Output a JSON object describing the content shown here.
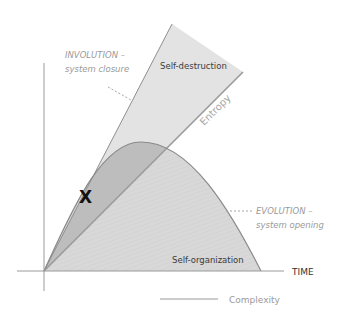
{
  "diagram": {
    "axes": {
      "x_label": "TIME",
      "origin": [
        44,
        271
      ]
    },
    "regions": {
      "self_destruction": "Self-destruction",
      "self_organization": "Self-organization"
    },
    "lines": {
      "entropy": "Entropy"
    },
    "annotations": {
      "involution_title": "INVOLUTION –",
      "involution_sub": "system closure",
      "evolution_title": "EVOLUTION –",
      "evolution_sub": "system opening",
      "marker": "X"
    },
    "legend": {
      "complexity": "Complexity"
    },
    "colors": {
      "axis": "#9a9a9a",
      "cone_fill": "#e2e2e2",
      "overlap_fill": "#bdbdbd",
      "curve_fill": "#d6d6d6",
      "line": "#8f8f8f",
      "muted_text": "#9a9a9a",
      "dark_text": "#333333"
    }
  }
}
